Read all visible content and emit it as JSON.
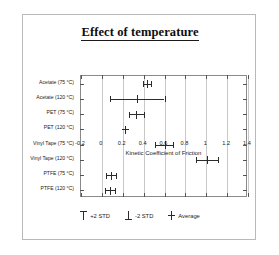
{
  "figure": {
    "title": "Effect of temperature"
  },
  "chart_data": {
    "type": "bar",
    "orientation": "horizontal",
    "title": "Effect of temperature",
    "xlabel": "Kinetic Coefficient of Friction",
    "ylabel": "",
    "xlim": [
      -0.2,
      1.4
    ],
    "xticks": [
      "-0.2",
      "0",
      "0.2",
      "0.4",
      "0.6",
      "0.8",
      "1",
      "1.2",
      "1.4"
    ],
    "xtick_values": [
      -0.2,
      0,
      0.2,
      0.4,
      0.6,
      0.8,
      1.0,
      1.2,
      1.4
    ],
    "grid": true,
    "grid_axis": "x",
    "legend_position": "below",
    "legend": [
      {
        "label": "+2 STD",
        "marker": "upper-cap"
      },
      {
        "label": "-2 STD",
        "marker": "lower-cap"
      },
      {
        "label": "Average",
        "marker": "cross"
      }
    ],
    "categories": [
      "Acetate (75 °C)",
      "Acetate (120 °C)",
      "PET (75 °C)",
      "PET (120 °C)",
      "Vinyl Tape (75 °C)",
      "Vinyl Tape (120 °C)",
      "PTFE (75 °C)",
      "PTFE (120 °C)"
    ],
    "series": [
      {
        "name": "Average",
        "values": [
          0.43,
          0.34,
          0.33,
          0.22,
          0.6,
          1.01,
          0.09,
          0.08
        ]
      },
      {
        "name": "-2 STD",
        "values": [
          0.39,
          0.08,
          0.26,
          0.22,
          0.51,
          0.9,
          0.04,
          0.03
        ]
      },
      {
        "name": "+2 STD",
        "values": [
          0.47,
          0.6,
          0.4,
          0.22,
          0.68,
          1.11,
          0.14,
          0.13
        ]
      }
    ],
    "points": [
      {
        "category": "Acetate (75 °C)",
        "average": 0.43,
        "low": 0.39,
        "high": 0.47
      },
      {
        "category": "Acetate (120 °C)",
        "average": 0.34,
        "low": 0.08,
        "high": 0.6
      },
      {
        "category": "PET (75 °C)",
        "average": 0.33,
        "low": 0.26,
        "high": 0.4
      },
      {
        "category": "PET (120 °C)",
        "average": 0.22,
        "low": 0.22,
        "high": 0.22
      },
      {
        "category": "Vinyl Tape (75 °C)",
        "average": 0.6,
        "low": 0.51,
        "high": 0.68
      },
      {
        "category": "Vinyl Tape (120 °C)",
        "average": 1.01,
        "low": 0.9,
        "high": 1.11
      },
      {
        "category": "PTFE (75 °C)",
        "average": 0.09,
        "low": 0.04,
        "high": 0.14
      },
      {
        "category": "PTFE (120 °C)",
        "average": 0.08,
        "low": 0.03,
        "high": 0.13
      }
    ]
  }
}
